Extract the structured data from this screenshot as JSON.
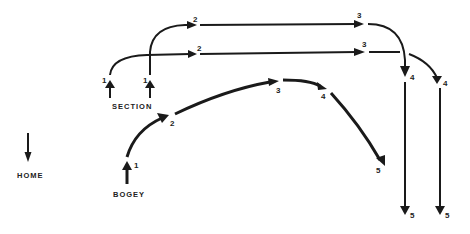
{
  "diagram": {
    "labels": {
      "section": "SECTION",
      "home": "HOME",
      "bogey": "BOGEY"
    },
    "section_upper": {
      "points": [
        "1",
        "2",
        "3",
        "4",
        "5"
      ]
    },
    "section_lower": {
      "points": [
        "1",
        "2",
        "3",
        "4",
        "5"
      ]
    },
    "bogey": {
      "points": [
        "1",
        "2",
        "3",
        "4",
        "5"
      ]
    },
    "colors": {
      "line": "#1a1a1a",
      "background": "#ffffff"
    }
  }
}
